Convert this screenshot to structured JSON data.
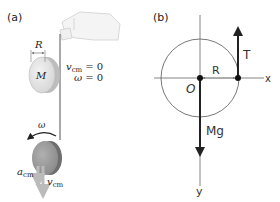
{
  "panel_a": {
    "label": "(a)",
    "radius_label": "R",
    "mass_label": "M",
    "vcm_symbol": "v",
    "vcm_sub": "cm",
    "vcm_initial": "= 0",
    "omega_symbol": "ω",
    "omega_initial": "= 0",
    "omega_falling": "ω",
    "acm_symbol": "a",
    "acm_sub": "cm",
    "vcm_falling_symbol": "v",
    "vcm_falling_sub": "cm"
  },
  "panel_b": {
    "label": "(b)",
    "tension_label": "T",
    "radius_label": "R",
    "origin_label": "O",
    "x_axis_label": "x",
    "y_axis_label": "y",
    "weight_label": "Mg"
  },
  "colors": {
    "disk_light": "#e4e4e4",
    "disk_dark": "#9b9b9b",
    "string": "#555555",
    "arrow": "#222222",
    "axis": "#555555"
  }
}
